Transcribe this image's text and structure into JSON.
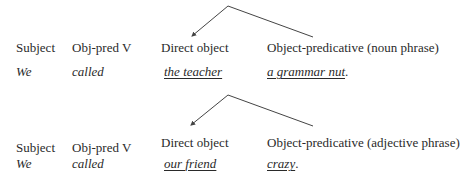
{
  "examples": [
    {
      "labels": {
        "subject": "Subject",
        "verb": "Obj-pred V",
        "direct_object": "Direct object",
        "object_predicative": "Object-predicative (noun phrase)"
      },
      "sentence": {
        "subject": "We",
        "verb": "called",
        "direct_object": "the teacher",
        "object_predicative": "a grammar nut",
        "end_punct": "."
      },
      "arrow": {
        "apex": [
          228,
          6
        ],
        "left_end": [
          192,
          36
        ],
        "right_end": [
          313,
          37
        ]
      }
    },
    {
      "labels": {
        "subject": "Subject",
        "verb": "Obj-pred V",
        "direct_object": "Direct object",
        "object_predicative": "Object-predicative (adjective phrase)"
      },
      "sentence": {
        "subject": "We",
        "verb": "called",
        "direct_object": "our friend",
        "object_predicative": "crazy",
        "end_punct": "."
      },
      "arrow": {
        "apex": [
          228,
          95
        ],
        "left_end": [
          191,
          125
        ],
        "right_end": [
          313,
          126
        ]
      }
    }
  ],
  "colors": {
    "text": "#2a2a2a",
    "line": "#444444"
  }
}
